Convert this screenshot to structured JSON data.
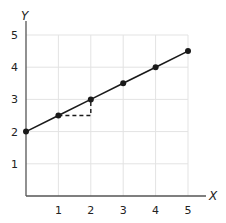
{
  "chart_data": {
    "type": "line",
    "title": "",
    "xlabel": "X",
    "ylabel": "Y",
    "xlim": [
      0,
      5
    ],
    "ylim": [
      0,
      5
    ],
    "grid": true,
    "x_ticks": [
      "1",
      "2",
      "3",
      "4",
      "5"
    ],
    "y_ticks": [
      "1",
      "2",
      "3",
      "4",
      "5"
    ],
    "series": [
      {
        "name": "line",
        "x": [
          0,
          1,
          2,
          3,
          4,
          5
        ],
        "y": [
          2,
          2.5,
          3,
          3.5,
          4,
          4.5
        ],
        "markers": true
      }
    ],
    "annotations": [
      {
        "type": "dashed-slope-triangle",
        "points": [
          [
            1,
            2.5
          ],
          [
            2,
            2.5
          ],
          [
            2,
            3
          ]
        ],
        "description": "run 1, rise 0.5"
      }
    ],
    "colors": {
      "line": "#1a1a1a",
      "grid": "#e3e3e3",
      "axis": "#555555"
    }
  }
}
